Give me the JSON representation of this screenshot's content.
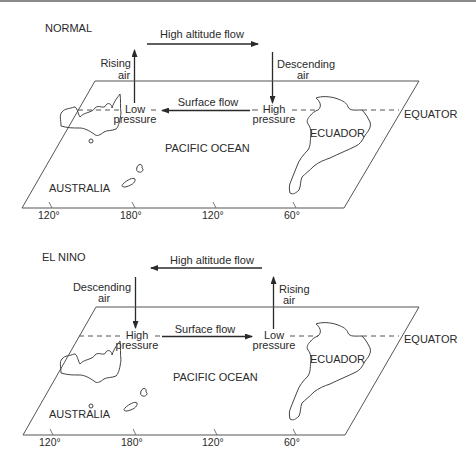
{
  "panels": [
    {
      "title": "NORMAL",
      "high_altitude_flow": "High altitude flow",
      "high_altitude_direction": "east",
      "surface_flow": "Surface flow",
      "surface_direction": "west",
      "left_vertical": {
        "line1": "Rising",
        "line2": "air"
      },
      "right_vertical": {
        "line1": "Descending",
        "line2": "air"
      },
      "left_pressure": {
        "line1": "Low",
        "line2": "pressure"
      },
      "right_pressure": {
        "line1": "High",
        "line2": "pressure"
      },
      "equator": "EQUATOR",
      "ocean": "PACIFIC OCEAN",
      "australia": "AUSTRALIA",
      "ecuador": "ECUADOR",
      "longitudes": [
        "120°",
        "180°",
        "120°",
        "60°"
      ]
    },
    {
      "title": "EL NINO",
      "high_altitude_flow": "High altitude flow",
      "high_altitude_direction": "west",
      "surface_flow": "Surface flow",
      "surface_direction": "east",
      "left_vertical": {
        "line1": "Descending",
        "line2": "air"
      },
      "right_vertical": {
        "line1": "Rising",
        "line2": "air"
      },
      "left_pressure": {
        "line1": "High",
        "line2": "pressure"
      },
      "right_pressure": {
        "line1": "Low",
        "line2": "pressure"
      },
      "equator": "EQUATOR",
      "ocean": "PACIFIC OCEAN",
      "australia": "AUSTRALIA",
      "ecuador": "ECUADOR",
      "longitudes": [
        "120°",
        "180°",
        "120°",
        "60°"
      ]
    }
  ],
  "colors": {
    "ink": "#2a2a2a",
    "line": "#555555",
    "background": "#ffffff"
  }
}
